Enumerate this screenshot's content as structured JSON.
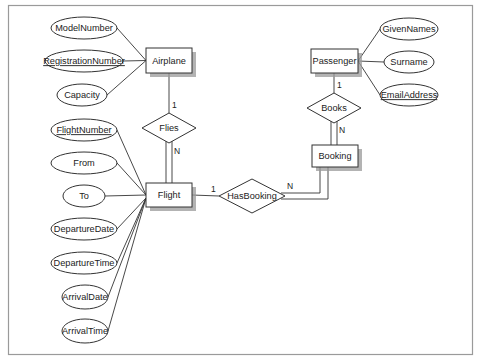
{
  "diagram": {
    "type": "entity-relationship",
    "entities": [
      {
        "id": "airplane",
        "label": "Airplane",
        "x": 146,
        "y": 48,
        "w": 46,
        "h": 25
      },
      {
        "id": "flight",
        "label": "Flight",
        "x": 146,
        "y": 183,
        "w": 46,
        "h": 24
      },
      {
        "id": "passenger",
        "label": "Passenger",
        "x": 311,
        "y": 49,
        "w": 47,
        "h": 24
      },
      {
        "id": "booking",
        "label": "Booking",
        "x": 312,
        "y": 145,
        "w": 46,
        "h": 22
      }
    ],
    "relationships": [
      {
        "id": "flies",
        "label": "Flies",
        "cx": 169,
        "cy": 128,
        "hw": 27,
        "hh": 15
      },
      {
        "id": "books",
        "label": "Books",
        "cx": 334,
        "cy": 108,
        "hw": 27,
        "hh": 15
      },
      {
        "id": "hasbooking",
        "label": "HasBooking",
        "cx": 252,
        "cy": 196,
        "hw": 33,
        "hh": 17
      }
    ],
    "attributes": [
      {
        "label": "ModelNumber",
        "entity": "airplane",
        "key": false,
        "cx": 84,
        "cy": 28,
        "rx": 33,
        "ry": 11
      },
      {
        "label": "RegistrationNumber",
        "entity": "airplane",
        "key": true,
        "cx": 84,
        "cy": 61,
        "rx": 39,
        "ry": 11
      },
      {
        "label": "Capacity",
        "entity": "airplane",
        "key": false,
        "cx": 82,
        "cy": 95,
        "rx": 25,
        "ry": 11
      },
      {
        "label": "GivenNames",
        "entity": "passenger",
        "key": false,
        "cx": 409,
        "cy": 29,
        "rx": 29,
        "ry": 11
      },
      {
        "label": "Surname",
        "entity": "passenger",
        "key": false,
        "cx": 409,
        "cy": 62,
        "rx": 25,
        "ry": 11
      },
      {
        "label": "EmailAddress",
        "entity": "passenger",
        "key": true,
        "cx": 409,
        "cy": 95,
        "rx": 29,
        "ry": 11
      },
      {
        "label": "FlightNumber",
        "entity": "flight",
        "key": true,
        "cx": 84,
        "cy": 130,
        "rx": 33,
        "ry": 11
      },
      {
        "label": "From",
        "entity": "flight",
        "key": false,
        "cx": 84,
        "cy": 163,
        "rx": 33,
        "ry": 11
      },
      {
        "label": "To",
        "entity": "flight",
        "key": false,
        "cx": 84,
        "cy": 196,
        "rx": 21,
        "ry": 11
      },
      {
        "label": "DepartureDate",
        "entity": "flight",
        "key": false,
        "cx": 84,
        "cy": 229,
        "rx": 33,
        "ry": 11
      },
      {
        "label": "DepartureTime",
        "entity": "flight",
        "key": false,
        "cx": 84,
        "cy": 263,
        "rx": 33,
        "ry": 11
      },
      {
        "label": "ArrivalDate",
        "entity": "flight",
        "key": false,
        "cx": 85,
        "cy": 297,
        "rx": 23,
        "ry": 12
      },
      {
        "label": "ArrivalTime",
        "entity": "flight",
        "key": false,
        "cx": 85,
        "cy": 331,
        "rx": 23,
        "ry": 12
      }
    ],
    "cardinalities": [
      {
        "label": "1",
        "x": 172,
        "y": 108,
        "rel": "flies-airplane"
      },
      {
        "label": "N",
        "x": 174,
        "y": 154,
        "rel": "flies-flight"
      },
      {
        "label": "1",
        "x": 337,
        "y": 88,
        "rel": "books-passenger"
      },
      {
        "label": "N",
        "x": 339,
        "y": 133,
        "rel": "books-booking"
      },
      {
        "label": "1",
        "x": 211,
        "y": 192,
        "rel": "hasbooking-flight"
      },
      {
        "label": "N",
        "x": 287,
        "y": 189,
        "rel": "hasbooking-booking"
      }
    ],
    "participation": {
      "flies-flight": "total",
      "books-booking": "total",
      "hasbooking-booking": "total"
    }
  }
}
